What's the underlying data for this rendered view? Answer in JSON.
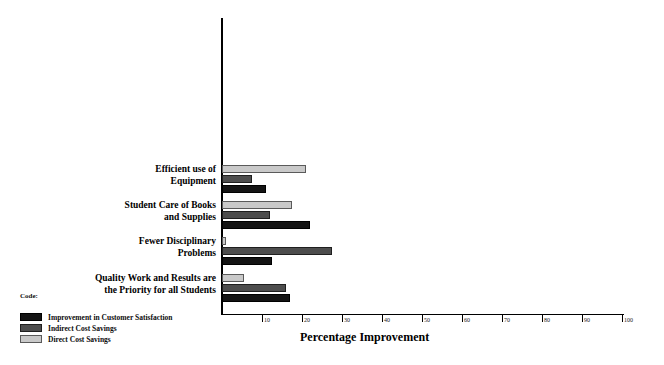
{
  "chart_data": {
    "type": "bar",
    "orientation": "horizontal",
    "title": "",
    "xlabel": "Percentage Improvement",
    "ylabel": "",
    "xlim": [
      0,
      100
    ],
    "xticks": [
      10,
      20,
      30,
      40,
      50,
      60,
      70,
      80,
      90,
      100
    ],
    "xtick_labels": [
      "10",
      "20",
      "30",
      "40",
      "50",
      "60",
      "70",
      "80",
      "90",
      "100"
    ],
    "grid": false,
    "legend_position": "lower-left",
    "legend_title": "Code:",
    "categories": [
      "Efficient use of Equipment",
      "Student Care of Books and Supplies",
      "Fewer Disciplinary Problems",
      "Quality Work and Results are the Priority for all Students"
    ],
    "series": [
      {
        "name": "Direct Cost  Savings",
        "color": "#c9c9c9",
        "values": [
          21,
          17.5,
          1,
          5.5
        ]
      },
      {
        "name": "Indirect Cost Savings",
        "color": "#4d4d4d",
        "values": [
          7.5,
          12,
          27.5,
          16
        ]
      },
      {
        "name": "Improvement in Customer Satisfaction",
        "color": "#141414",
        "values": [
          11,
          22,
          12.5,
          17
        ]
      }
    ]
  },
  "category_labels": [
    {
      "line1": "Efficient use of",
      "line2": "Equipment"
    },
    {
      "line1": "Student Care of Books",
      "line2": "and Supplies"
    },
    {
      "line1": "Fewer Disciplinary",
      "line2": "Problems"
    },
    {
      "line1": "Quality Work and Results are",
      "line2": "the Priority for all Students"
    }
  ],
  "axis": {
    "title": "Percentage Improvement"
  },
  "legend": {
    "title": "Code:",
    "items": [
      {
        "label": "Improvement in Customer Satisfaction",
        "series": "improvement"
      },
      {
        "label": "Indirect Cost Savings",
        "series": "indirect"
      },
      {
        "label": "Direct Cost  Savings",
        "series": "direct"
      }
    ]
  }
}
